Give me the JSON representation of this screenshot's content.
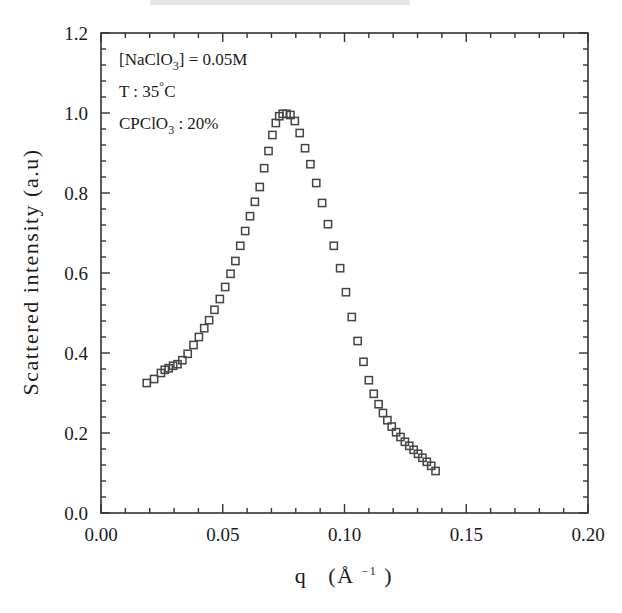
{
  "chart_data": {
    "type": "scatter",
    "title": "",
    "xlabel": "q  (Å⁻¹)",
    "ylabel": "Scattered intensity (a.u)",
    "xlim": [
      0.0,
      0.2
    ],
    "ylim": [
      0.0,
      1.2
    ],
    "xticks": [
      0.0,
      0.05,
      0.1,
      0.15,
      0.2
    ],
    "xticklabels": [
      "0.00",
      "0.05",
      "0.10",
      "0.15",
      "0.20"
    ],
    "yticks": [
      0.0,
      0.2,
      0.4,
      0.6,
      0.8,
      1.0,
      1.2
    ],
    "yticklabels": [
      "0.0",
      "0.2",
      "0.4",
      "0.6",
      "0.8",
      "1.0",
      "1.2"
    ],
    "minor_ticks_per_interval": 5,
    "grid": false,
    "legend": false,
    "marker": "open-square",
    "marker_color": "#444444",
    "series": [
      {
        "name": "scattered intensity",
        "x": [
          0.0188,
          0.0218,
          0.0246,
          0.0262,
          0.0278,
          0.0296,
          0.0314,
          0.0334,
          0.0356,
          0.038,
          0.0402,
          0.0424,
          0.0444,
          0.0466,
          0.0488,
          0.051,
          0.0532,
          0.0552,
          0.0572,
          0.0592,
          0.0612,
          0.0632,
          0.0652,
          0.067,
          0.0688,
          0.0704,
          0.0718,
          0.0732,
          0.0746,
          0.0762,
          0.0778,
          0.0796,
          0.0816,
          0.0838,
          0.086,
          0.0884,
          0.0908,
          0.0932,
          0.0956,
          0.0982,
          0.1006,
          0.103,
          0.1054,
          0.1078,
          0.11,
          0.112,
          0.114,
          0.1158,
          0.1176,
          0.1194,
          0.1212,
          0.123,
          0.1248,
          0.1266,
          0.1284,
          0.1302,
          0.132,
          0.1338,
          0.1356,
          0.1374
        ],
        "y": [
          0.325,
          0.335,
          0.35,
          0.358,
          0.362,
          0.368,
          0.372,
          0.382,
          0.398,
          0.42,
          0.44,
          0.462,
          0.482,
          0.508,
          0.535,
          0.565,
          0.598,
          0.63,
          0.668,
          0.705,
          0.742,
          0.778,
          0.815,
          0.862,
          0.905,
          0.945,
          0.975,
          0.992,
          0.998,
          0.998,
          0.995,
          0.98,
          0.95,
          0.912,
          0.872,
          0.825,
          0.775,
          0.722,
          0.668,
          0.612,
          0.552,
          0.49,
          0.43,
          0.378,
          0.332,
          0.298,
          0.272,
          0.25,
          0.232,
          0.216,
          0.202,
          0.19,
          0.178,
          0.168,
          0.158,
          0.148,
          0.138,
          0.128,
          0.118,
          0.105
        ]
      }
    ],
    "annotations": [
      {
        "id": "concentration",
        "text": "[NaClO",
        "sub": "3",
        "tail": "]  =  0.05M"
      },
      {
        "id": "temperature",
        "text": "T  :  35",
        "sup": "°",
        "tail": "C"
      },
      {
        "id": "surfactant",
        "text": "CPClO",
        "sub": "3",
        "tail": "  :  20%"
      }
    ]
  },
  "axis": {
    "xlabel_main": "q",
    "xlabel_unit_open": "(Å",
    "xlabel_unit_exp": "−1",
    "xlabel_unit_close": ")",
    "ylabel": "Scattered intensity (a.u)"
  },
  "colors": {
    "axis": "#333333",
    "marker": "#4a4a4a",
    "text": "#1a1a1a",
    "background": "#ffffff"
  }
}
